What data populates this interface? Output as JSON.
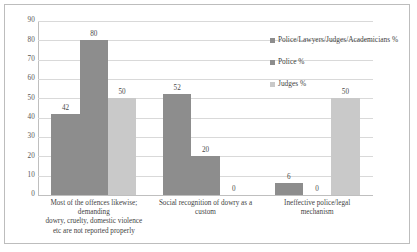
{
  "chart_data": {
    "type": "bar",
    "title": "",
    "subtitle": "",
    "xlabel": "",
    "ylabel": "",
    "ylim": [
      0,
      90
    ],
    "ytick_step": 10,
    "yticks": [
      "90",
      "80",
      "70",
      "60",
      "50",
      "40",
      "30",
      "20",
      "10",
      "0"
    ],
    "grid": true,
    "legend_position": "top-right",
    "categories": [
      "Most of the offences likewise; demanding\ndowry, cruelty, domestic violence\netc are not reported properly",
      "Social recognition of dowry as a\ncustom",
      "Ineffective police/legal\nmechanism"
    ],
    "category_lines": [
      [
        "Most of the offences likewise;",
        "demanding",
        "dowry, cruelty, domestic violence",
        "etc are not reported properly"
      ],
      [
        "Social recognition of dowry as a",
        "custom"
      ],
      [
        "Ineffective police/legal",
        "mechanism"
      ]
    ],
    "series": [
      {
        "name": "Police/Lawyers/Judges/Academicians %",
        "color": "#8d8d8d",
        "values": [
          42,
          52,
          6
        ],
        "labels": [
          "42",
          "52",
          "6"
        ]
      },
      {
        "name": "Police %",
        "color": "#8d8d8d",
        "values": [
          80,
          20,
          0
        ],
        "labels": [
          "80",
          "20",
          "0"
        ]
      },
      {
        "name": "Judges %",
        "color": "#c9c9c9",
        "values": [
          50,
          0,
          50
        ],
        "labels": [
          "50",
          "0",
          "50"
        ]
      }
    ]
  },
  "colors": {
    "series_1": "#8d8d8d",
    "series_2": "#8d8d8d",
    "series_3": "#c9c9c9",
    "gridline": "#d9d9d9",
    "axis": "#bfbfbf",
    "frame_border": "#bdbdbd",
    "text": "#3f3f3f",
    "background": "#ffffff"
  }
}
